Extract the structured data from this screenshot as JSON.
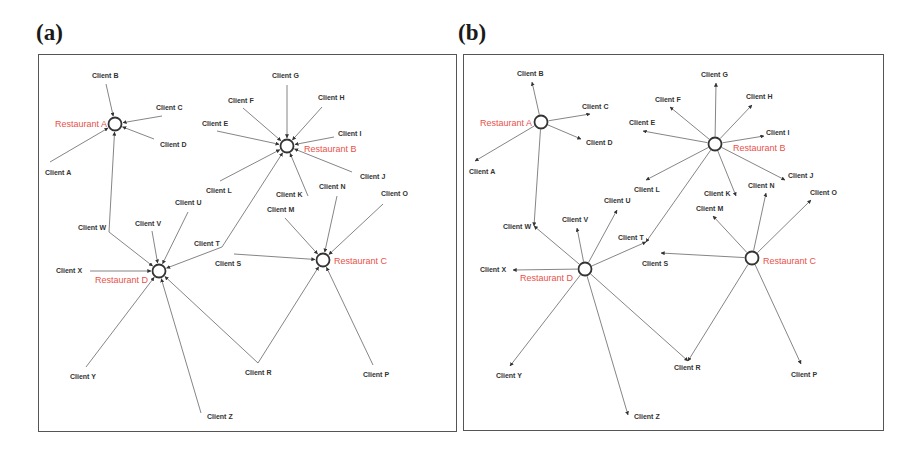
{
  "panels": [
    {
      "id": "a",
      "label": "(a)",
      "direction": "client-to-restaurant",
      "restaurants": [
        "Restaurant A",
        "Restaurant B",
        "Restaurant C",
        "Restaurant D"
      ],
      "clients": [
        "Client A",
        "Client B",
        "Client C",
        "Client D",
        "Client E",
        "Client F",
        "Client G",
        "Client H",
        "Client I",
        "Client J",
        "Client K",
        "Client L",
        "Client M",
        "Client N",
        "Client O",
        "Client P",
        "Client R",
        "Client S",
        "Client T",
        "Client U",
        "Client V",
        "Client W",
        "Client X",
        "Client Y",
        "Client Z"
      ],
      "edges": [
        [
          "Client A",
          "Restaurant A"
        ],
        [
          "Client B",
          "Restaurant A"
        ],
        [
          "Client C",
          "Restaurant A"
        ],
        [
          "Client D",
          "Restaurant A"
        ],
        [
          "Client W",
          "Restaurant A"
        ],
        [
          "Client E",
          "Restaurant B"
        ],
        [
          "Client F",
          "Restaurant B"
        ],
        [
          "Client G",
          "Restaurant B"
        ],
        [
          "Client H",
          "Restaurant B"
        ],
        [
          "Client I",
          "Restaurant B"
        ],
        [
          "Client J",
          "Restaurant B"
        ],
        [
          "Client K",
          "Restaurant B"
        ],
        [
          "Client L",
          "Restaurant B"
        ],
        [
          "Client T",
          "Restaurant B"
        ],
        [
          "Client M",
          "Restaurant C"
        ],
        [
          "Client N",
          "Restaurant C"
        ],
        [
          "Client O",
          "Restaurant C"
        ],
        [
          "Client P",
          "Restaurant C"
        ],
        [
          "Client R",
          "Restaurant C"
        ],
        [
          "Client S",
          "Restaurant C"
        ],
        [
          "Client T",
          "Restaurant D"
        ],
        [
          "Client U",
          "Restaurant D"
        ],
        [
          "Client V",
          "Restaurant D"
        ],
        [
          "Client W",
          "Restaurant D"
        ],
        [
          "Client X",
          "Restaurant D"
        ],
        [
          "Client Y",
          "Restaurant D"
        ],
        [
          "Client Z",
          "Restaurant D"
        ],
        [
          "Client R",
          "Restaurant D"
        ]
      ]
    },
    {
      "id": "b",
      "label": "(b)",
      "direction": "restaurant-to-client",
      "restaurants": [
        "Restaurant A",
        "Restaurant B",
        "Restaurant C",
        "Restaurant D"
      ],
      "clients": [
        "Client A",
        "Client B",
        "Client C",
        "Client D",
        "Client E",
        "Client F",
        "Client G",
        "Client H",
        "Client I",
        "Client J",
        "Client K",
        "Client L",
        "Client M",
        "Client N",
        "Client O",
        "Client P",
        "Client R",
        "Client S",
        "Client T",
        "Client U",
        "Client V",
        "Client W",
        "Client X",
        "Client Y",
        "Client Z"
      ],
      "edges": [
        [
          "Restaurant A",
          "Client A"
        ],
        [
          "Restaurant A",
          "Client B"
        ],
        [
          "Restaurant A",
          "Client C"
        ],
        [
          "Restaurant A",
          "Client D"
        ],
        [
          "Restaurant A",
          "Client W"
        ],
        [
          "Restaurant B",
          "Client E"
        ],
        [
          "Restaurant B",
          "Client F"
        ],
        [
          "Restaurant B",
          "Client G"
        ],
        [
          "Restaurant B",
          "Client H"
        ],
        [
          "Restaurant B",
          "Client I"
        ],
        [
          "Restaurant B",
          "Client J"
        ],
        [
          "Restaurant B",
          "Client K"
        ],
        [
          "Restaurant B",
          "Client L"
        ],
        [
          "Restaurant B",
          "Client T"
        ],
        [
          "Restaurant C",
          "Client M"
        ],
        [
          "Restaurant C",
          "Client N"
        ],
        [
          "Restaurant C",
          "Client O"
        ],
        [
          "Restaurant C",
          "Client P"
        ],
        [
          "Restaurant C",
          "Client R"
        ],
        [
          "Restaurant C",
          "Client S"
        ],
        [
          "Restaurant D",
          "Client T"
        ],
        [
          "Restaurant D",
          "Client U"
        ],
        [
          "Restaurant D",
          "Client V"
        ],
        [
          "Restaurant D",
          "Client W"
        ],
        [
          "Restaurant D",
          "Client X"
        ],
        [
          "Restaurant D",
          "Client Y"
        ],
        [
          "Restaurant D",
          "Client Z"
        ],
        [
          "Restaurant D",
          "Client R"
        ]
      ]
    }
  ],
  "colors": {
    "restaurant_label": "#e8524a",
    "client_label": "#333333",
    "edge": "#666666"
  }
}
